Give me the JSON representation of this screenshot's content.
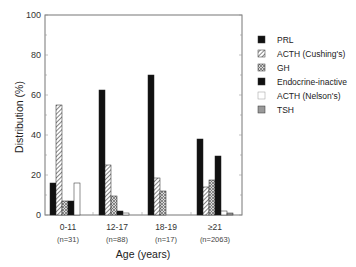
{
  "chart_data": {
    "type": "bar",
    "title": "",
    "xlabel": "Age (years)",
    "ylabel": "Distribution (%)",
    "ylim": [
      0,
      100
    ],
    "yticks": [
      0,
      20,
      40,
      60,
      80,
      100
    ],
    "grid": false,
    "legend_position": "right",
    "categories": [
      "0-11",
      "12-17",
      "18-19",
      "≥21"
    ],
    "category_notes": [
      "(n=31)",
      "(n=88)",
      "(n=17)",
      "(n=2063)"
    ],
    "series": [
      {
        "name": "PRL",
        "fill": "solid-black",
        "values": [
          16,
          62.5,
          70,
          38
        ]
      },
      {
        "name": "ACTH (Cushing's)",
        "fill": "hatch-diagonal",
        "values": [
          55,
          25,
          18.5,
          14
        ]
      },
      {
        "name": "GH",
        "fill": "hatch-cross",
        "values": [
          7,
          9.5,
          12,
          17.5
        ]
      },
      {
        "name": "Endocrine-inactive",
        "fill": "solid-black",
        "values": [
          7,
          2,
          0,
          29.5
        ]
      },
      {
        "name": "ACTH (Nelson's)",
        "fill": "white",
        "values": [
          16,
          1,
          0,
          2
        ]
      },
      {
        "name": "TSH",
        "fill": "gray",
        "values": [
          0,
          0,
          0,
          1
        ]
      }
    ]
  },
  "colors": {
    "black": "#111111",
    "hatch_line": "#555555",
    "gray": "#9a9a9a",
    "axis": "#777777"
  }
}
